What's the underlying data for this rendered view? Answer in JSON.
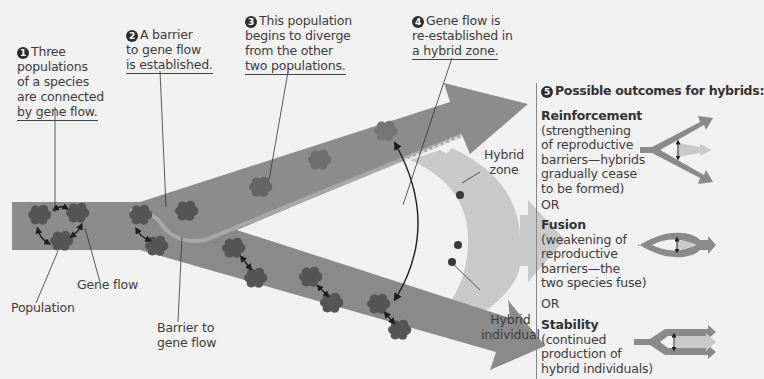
{
  "diagram": {
    "type": "hybrid-zone-formation",
    "colors": {
      "background": "#f1f1f1",
      "branch": "#8c8c8c",
      "branch_dark": "#7a7a7a",
      "population": "#555555",
      "population_diverged": "#6e6e6e",
      "hybrid_zone": "#c9c9c9",
      "hybrid_individual": "#3a3a3a",
      "barrier": "#a6a6a6"
    }
  },
  "steps": [
    {
      "number": "1",
      "text_lines": [
        "Three",
        "populations",
        "of a species",
        "are connected",
        "by gene flow."
      ]
    },
    {
      "number": "2",
      "text_lines": [
        "A barrier",
        "to gene flow",
        "is established."
      ]
    },
    {
      "number": "3",
      "text_lines": [
        "This population",
        "begins to diverge",
        "from the other",
        "two populations."
      ]
    },
    {
      "number": "4",
      "text_lines": [
        "Gene flow is",
        "re-established in",
        "a hybrid zone."
      ]
    }
  ],
  "labels": {
    "population": "Population",
    "gene_flow": "Gene flow",
    "barrier_lines": [
      "Barrier to",
      "gene flow"
    ],
    "hybrid_zone_lines": [
      "Hybrid",
      "zone"
    ],
    "hybrid_individual_lines": [
      "Hybrid",
      "individual"
    ]
  },
  "outcomes": {
    "number": "5",
    "title": "Possible outcomes for hybrids:",
    "or_label": "OR",
    "items": [
      {
        "name": "Reinforcement",
        "desc_lines": [
          "(strengthening",
          "of reproductive",
          "barriers—hybrids",
          "gradually cease",
          "to be formed)"
        ]
      },
      {
        "name": "Fusion",
        "desc_lines": [
          "(weakening of",
          "reproductive",
          "barriers—the",
          "two species fuse)"
        ]
      },
      {
        "name": "Stability",
        "desc_lines": [
          "(continued",
          "production of",
          "hybrid individuals)"
        ]
      }
    ]
  }
}
